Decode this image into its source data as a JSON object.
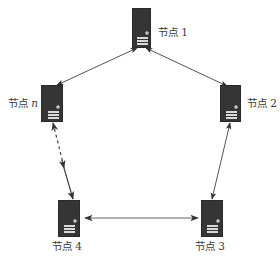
{
  "diagram": {
    "type": "ring-network",
    "line_color": "#444444",
    "server_color": "#353535",
    "nodes": [
      {
        "id": "node-1",
        "label_prefix": "节点",
        "label_suffix": "1",
        "suffix_italic": false,
        "icon": "server-icon"
      },
      {
        "id": "node-2",
        "label_prefix": "节点",
        "label_suffix": "2",
        "suffix_italic": false,
        "icon": "server-icon"
      },
      {
        "id": "node-3",
        "label_prefix": "节点",
        "label_suffix": "3",
        "suffix_italic": false,
        "icon": "server-icon"
      },
      {
        "id": "node-4",
        "label_prefix": "节点",
        "label_suffix": "4",
        "suffix_italic": false,
        "icon": "server-icon"
      },
      {
        "id": "node-n",
        "label_prefix": "节点",
        "label_suffix": "n",
        "suffix_italic": true,
        "icon": "server-icon"
      }
    ],
    "edges": [
      {
        "from": "node-1",
        "to": "node-2",
        "style": "solid",
        "direction": "bidirectional"
      },
      {
        "from": "node-2",
        "to": "node-3",
        "style": "solid",
        "direction": "bidirectional"
      },
      {
        "from": "node-3",
        "to": "node-4",
        "style": "solid",
        "direction": "bidirectional"
      },
      {
        "from": "node-4",
        "to": "node-n",
        "style": "dashed-partial",
        "direction": "bidirectional"
      },
      {
        "from": "node-n",
        "to": "node-1",
        "style": "solid",
        "direction": "bidirectional"
      }
    ]
  }
}
